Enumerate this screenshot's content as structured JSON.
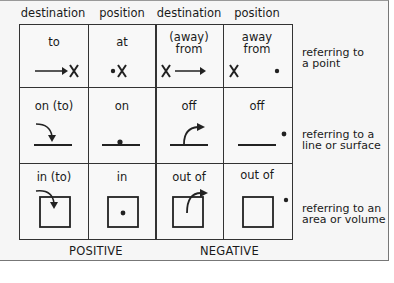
{
  "column_headers": [
    "destination",
    "position",
    "destination",
    "position"
  ],
  "rows": [
    {
      "cells": [
        "to",
        "at",
        "(away) from",
        "away from"
      ],
      "cells_lines": [
        [
          "to"
        ],
        [
          "at"
        ],
        [
          "(away)",
          "from"
        ],
        [
          "away",
          "from"
        ]
      ],
      "side_label": [
        "referring to",
        "a point"
      ],
      "icons": [
        "arrow-to-x-icon",
        "dot-x-icon",
        "x-arrow-away-icon",
        "x-dot-away-icon"
      ]
    },
    {
      "cells": [
        "on (to)",
        "on",
        "off",
        "off"
      ],
      "side_label": [
        "referring to a",
        "line or surface"
      ],
      "icons": [
        "arrow-onto-line-icon",
        "dot-on-line-icon",
        "arrow-off-line-icon",
        "dot-off-line-icon"
      ]
    },
    {
      "cells": [
        "in (to)",
        "in",
        "out of",
        "out of"
      ],
      "side_label": [
        "referring to an",
        "area or volume"
      ],
      "icons": [
        "arrow-into-box-icon",
        "dot-in-box-icon",
        "arrow-out-of-box-icon",
        "dot-out-of-box-icon"
      ]
    }
  ],
  "footer": {
    "positive": "POSITIVE",
    "negative": "NEGATIVE"
  }
}
